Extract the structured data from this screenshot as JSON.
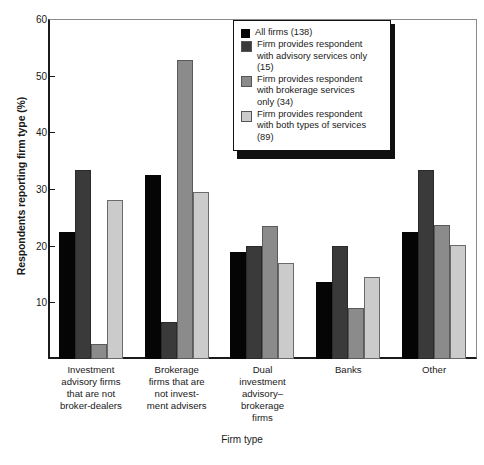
{
  "chart_data": {
    "type": "bar",
    "title": "",
    "xlabel": "Firm type",
    "ylabel": "Respondents reporting firm type (%)",
    "ylim": [
      0,
      60
    ],
    "yticks": [
      10,
      20,
      30,
      40,
      50,
      60
    ],
    "grid": false,
    "legend_position": "upper-center-right",
    "categories": [
      "Investment\nadvisory firms\nthat are not\nbroker-dealers",
      "Brokerage\nfirms that are\nnot invest-\nment advisers",
      "Dual\ninvestment\nadvisory–\nbrokerage\nfirms",
      "Banks",
      "Other"
    ],
    "series": [
      {
        "name": "All firms (138)",
        "color": "#050505",
        "values": [
          22.4,
          32.4,
          18.8,
          13.6,
          22.4
        ]
      },
      {
        "name": "Firm provides respondent\nwith advisory services only\n(15)",
        "color": "#3a3a3a",
        "values": [
          33.3,
          6.6,
          20.0,
          20.0,
          33.3
        ]
      },
      {
        "name": "Firm provides respondent\nwith brokerage services\nonly (34)",
        "color": "#8b8b8b",
        "values": [
          2.6,
          52.8,
          23.5,
          9.0,
          23.7
        ]
      },
      {
        "name": "Firm provides respondent\nwith both types of services\n(89)",
        "color": "#cbcbcb",
        "values": [
          28.1,
          29.4,
          16.9,
          14.5,
          20.1
        ]
      }
    ]
  },
  "axis": {
    "y_title": "Respondents reporting firm type (%)",
    "x_title": "Firm type",
    "tick_labels": [
      "60",
      "50",
      "40",
      "30",
      "20",
      "10"
    ]
  },
  "legend": {
    "items": [
      {
        "label": "All firms (138)",
        "swatch": "series-0-swatch"
      },
      {
        "label": "Firm provides respondent\nwith advisory services only\n(15)",
        "swatch": "series-1-swatch"
      },
      {
        "label": "Firm provides respondent\nwith brokerage services\nonly (34)",
        "swatch": "series-2-swatch"
      },
      {
        "label": "Firm provides respondent\nwith both types of services\n(89)",
        "swatch": "series-3-swatch"
      }
    ]
  },
  "footnote": {
    "text": ""
  }
}
